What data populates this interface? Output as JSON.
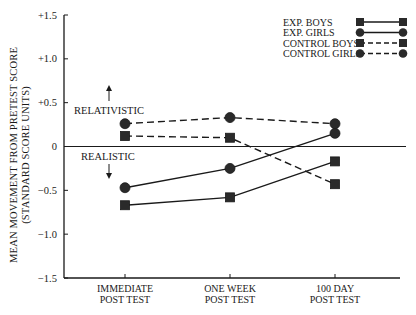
{
  "chart_data": {
    "type": "line",
    "title": "",
    "xlabel": "",
    "ylabel": "MEAN MOVEMENT FROM PRETEST SCORE",
    "ylabel_sub": "(STANDARD SCORE UNITS)",
    "categories": [
      "IMMEDIATE POST TEST",
      "ONE WEEK POST TEST",
      "100 DAY POST TEST"
    ],
    "category_lines": [
      [
        "IMMEDIATE",
        "POST TEST"
      ],
      [
        "ONE WEEK",
        "POST TEST"
      ],
      [
        "100 DAY",
        "POST TEST"
      ]
    ],
    "ylim": [
      -1.5,
      1.5
    ],
    "yticks": [
      1.5,
      1.0,
      0.5,
      0,
      -0.5,
      -1.0,
      -1.5
    ],
    "ytick_labels": [
      "+1.5",
      "+1.0",
      "+0.5",
      "0",
      "−0.5",
      "−1.0",
      "−1.5"
    ],
    "grid": false,
    "legend_position": "top-right",
    "annotations": [
      {
        "text": "RELATIVISTIC",
        "arrow": "up",
        "y": 0.33
      },
      {
        "text": "REALISTIC",
        "arrow": "down",
        "y": -0.1
      }
    ],
    "series": [
      {
        "name": "EXP. BOYS",
        "values": [
          -0.67,
          -0.58,
          -0.17
        ],
        "marker": "square",
        "line": "solid"
      },
      {
        "name": "EXP. GIRLS",
        "values": [
          -0.47,
          -0.25,
          0.15
        ],
        "marker": "circle",
        "line": "solid"
      },
      {
        "name": "CONTROL BOYS",
        "values": [
          0.12,
          0.1,
          -0.43
        ],
        "marker": "square",
        "line": "dashed"
      },
      {
        "name": "CONTROL GIRLS",
        "values": [
          0.26,
          0.33,
          0.26
        ],
        "marker": "circle",
        "line": "dashed"
      }
    ]
  },
  "colors": {
    "ink": "#1a1a1a",
    "marker": "#2a2a2a",
    "background": "#ffffff"
  }
}
